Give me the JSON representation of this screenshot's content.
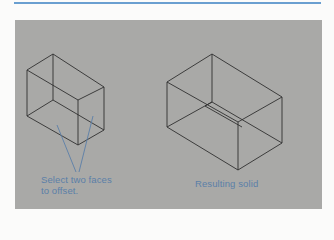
{
  "header": {
    "rule_color": "#6a9fd0"
  },
  "panel": {
    "background": "#a9a9a7"
  },
  "figure": {
    "left_box": {
      "description": "Box before offset",
      "label_line1": "Select two faces",
      "label_line2": "to offset.",
      "leader_color": "#5b7fa8"
    },
    "right_box": {
      "description": "Box after offset",
      "label": "Resulting solid"
    },
    "text_color": "#5b7fa8",
    "edge_color": "#2e2e2e"
  }
}
